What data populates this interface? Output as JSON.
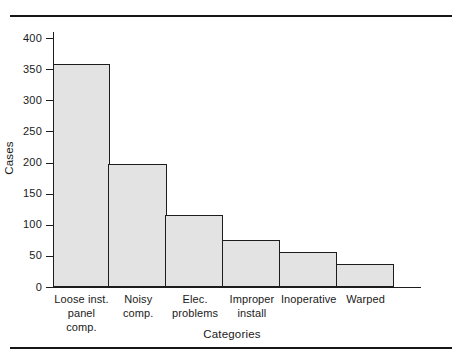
{
  "figure": {
    "has_top_rule": true,
    "has_bottom_rule": true
  },
  "chart_data": {
    "type": "bar",
    "title": "",
    "subtitle": "",
    "xlabel": "Categories",
    "ylabel": "Cases",
    "categories": [
      "Loose inst. panel comp.",
      "Noisy comp.",
      "Elec. problems",
      "Improper install",
      "Inoperative",
      "Warped"
    ],
    "category_lines": [
      [
        "Loose inst.",
        "panel comp."
      ],
      [
        "Noisy",
        "comp."
      ],
      [
        "Elec.",
        "problems"
      ],
      [
        "Improper",
        "install"
      ],
      [
        "Inoperative",
        ""
      ],
      [
        "Warped",
        ""
      ]
    ],
    "values": [
      358,
      197,
      115,
      75,
      56,
      37
    ],
    "ylim": [
      0,
      400
    ],
    "yticks": [
      0,
      50,
      100,
      150,
      200,
      250,
      300,
      350,
      400
    ],
    "ytick_labels": [
      "0",
      "50",
      "100",
      "150",
      "200",
      "250",
      "300",
      "350",
      "400"
    ],
    "grid": false,
    "legend": null,
    "bar_fill_color": "#e3e3e3",
    "bar_edge_color": "#1d1d1d",
    "axis_color": "#1d1d1d"
  }
}
